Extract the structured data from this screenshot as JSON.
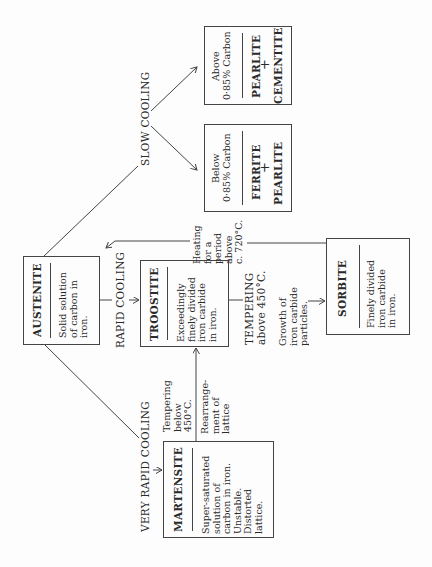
{
  "nodes": {
    "austenite": {
      "name": "AUSTENITE",
      "desc": "Solid solution\nof carbon in\niron."
    },
    "troostite": {
      "name": "TROOSTITE",
      "desc": "Exceedingly\nfinely divided\niron carbide\nin iron."
    },
    "sorbite": {
      "name": "SORBITE",
      "desc": "Finely divided\niron carbide\nin iron."
    },
    "martensite": {
      "name": "MARTENSITE",
      "desc": "Super-saturated\nsolution of\ncarbon in iron.\nUnstable.\nDistorted\nlattice."
    },
    "below": {
      "condition": "Below\n0·85% Carbon",
      "phase1": "FERRITE",
      "plus": "+",
      "phase2": "PEARLITE"
    },
    "above": {
      "condition": "Above\n0·85% Carbon",
      "phase1": "PEARLITE",
      "plus": "+",
      "phase2": "CEMENTITE"
    }
  },
  "edges": {
    "slow_cooling": "SLOW COOLING",
    "rapid_cooling": "RAPID COOLING",
    "very_rapid_cooling": "VERY RAPID COOLING",
    "tempering_above": "TEMPERING\nabove 450°C.",
    "tempering_below": "Tempering\nbelow\n450°C.",
    "rearrangement": "Rearrange-\nment of\nlattice",
    "growth": "Growth of\niron carbide\nparticles.",
    "heating": "Heating\nfor a\nperiod\nabove\nc. 720°C."
  },
  "colors": {
    "ink": "#2a2a2a",
    "line": "#444444",
    "paper": "#fdfdfd"
  }
}
